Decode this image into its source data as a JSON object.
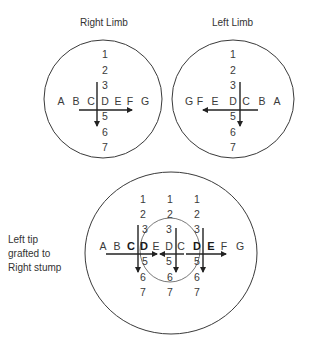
{
  "figure": {
    "right_limb": {
      "title": "Right Limb",
      "proximodistal_labels": [
        "1",
        "2",
        "3",
        "D",
        "5",
        "6",
        "7"
      ],
      "anteroposterior_labels": [
        "A",
        "B",
        "C",
        "D",
        "E",
        "F",
        "G"
      ],
      "horizontal_arrow_direction": "right",
      "vertical_arrow_direction": "down"
    },
    "left_limb": {
      "title": "Left Limb",
      "proximodistal_labels": [
        "1",
        "2",
        "3",
        "D",
        "5",
        "6",
        "7"
      ],
      "anteroposterior_labels": [
        "G",
        "F",
        "E",
        "D",
        "C",
        "B",
        "A"
      ],
      "horizontal_arrow_direction": "left",
      "vertical_arrow_direction": "down"
    },
    "graft": {
      "caption_lines": [
        "Left tip",
        "grafted to",
        "Right stump"
      ],
      "row_labels": [
        "A",
        "B",
        "C",
        "D",
        "E",
        "D",
        "C",
        "D",
        "E",
        "F",
        "G"
      ],
      "bold_letters": [
        "C",
        "D",
        "D",
        "E"
      ],
      "column_numbers": [
        "1",
        "2",
        "3",
        "5",
        "6",
        "7"
      ],
      "column_count": 3
    }
  },
  "colors": {
    "ink": "#333333",
    "background": "#ffffff"
  }
}
